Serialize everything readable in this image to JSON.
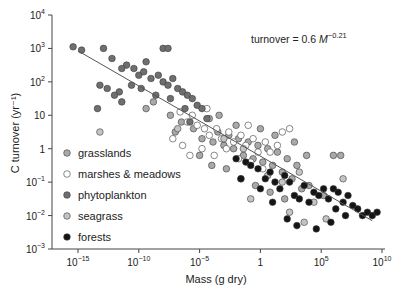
{
  "chart_data": {
    "type": "scatter",
    "title": "",
    "xlabel": "Mass (g dry)",
    "ylabel": "C turnover (yr⁻¹)",
    "xscale": "log",
    "yscale": "log",
    "xlim_exp": [
      -17,
      10
    ],
    "ylim_exp": [
      -3,
      4
    ],
    "x_ticks": [
      {
        "exp": -15,
        "base": "10",
        "sup": "−15"
      },
      {
        "exp": -10,
        "base": "10",
        "sup": "−10"
      },
      {
        "exp": -5,
        "base": "10",
        "sup": "−5"
      },
      {
        "exp": 0,
        "base": "1",
        "sup": ""
      },
      {
        "exp": 5,
        "base": "10",
        "sup": "5"
      },
      {
        "exp": 10,
        "base": "10",
        "sup": "10"
      }
    ],
    "y_ticks": [
      {
        "exp": 4,
        "base": "10",
        "sup": "4"
      },
      {
        "exp": 3,
        "base": "10",
        "sup": "3"
      },
      {
        "exp": 2,
        "base": "10",
        "sup": "2"
      },
      {
        "exp": 1,
        "base": "10",
        "sup": ""
      },
      {
        "exp": 0,
        "base": "1",
        "sup": ""
      },
      {
        "exp": -1,
        "base": "10",
        "sup": "−1"
      },
      {
        "exp": -2,
        "base": "10",
        "sup": "−2"
      },
      {
        "exp": -3,
        "base": "10",
        "sup": "−3"
      }
    ],
    "annotation": {
      "prefix": "turnover = 0.6 ",
      "var": "M",
      "sup": "−0.21"
    },
    "fit_line": {
      "equation": "turnover = 0.6 M^-0.21",
      "x_exp_range": [
        -15,
        9.2
      ]
    },
    "grid": false,
    "legend_position": "lower-left inside",
    "series": [
      {
        "name": "grasslands",
        "color": "#a9a9a9",
        "points_log": [
          [
            -5.5,
            0.6
          ],
          [
            -4.8,
            0.3
          ],
          [
            -4.2,
            0.9
          ],
          [
            -3.9,
            0.2
          ],
          [
            -3.5,
            0.5
          ],
          [
            -3.0,
            0.1
          ],
          [
            -2.6,
            0.4
          ],
          [
            -2.2,
            0.0
          ],
          [
            -1.8,
            0.3
          ],
          [
            -1.4,
            -0.2
          ],
          [
            -1.0,
            0.2
          ],
          [
            -0.6,
            -0.3
          ],
          [
            -0.2,
            0.1
          ],
          [
            0.2,
            -0.4
          ],
          [
            0.6,
            0.0
          ],
          [
            1.0,
            -0.5
          ],
          [
            1.4,
            -0.1
          ],
          [
            1.8,
            -0.7
          ],
          [
            2.2,
            -0.3
          ],
          [
            2.6,
            -0.9
          ],
          [
            3.0,
            -0.5
          ],
          [
            3.4,
            -1.2
          ],
          [
            -2.8,
            -0.6
          ],
          [
            -1.6,
            -0.9
          ],
          [
            -0.4,
            -1.1
          ],
          [
            0.8,
            -1.3
          ],
          [
            2.0,
            -1.5
          ],
          [
            4.0,
            -1.1
          ],
          [
            5.2,
            -1.4
          ],
          [
            6.0,
            -0.2
          ],
          [
            6.6,
            -0.2
          ],
          [
            -3.4,
            1.0
          ],
          [
            -2.0,
            0.7
          ],
          [
            -6.5,
            0.8
          ],
          [
            -7.4,
            1.0
          ],
          [
            -7.0,
            0.5
          ],
          [
            -9.4,
            1.2
          ],
          [
            -8.8,
            1.4
          ],
          [
            -5.0,
            -0.2
          ],
          [
            -4.0,
            -0.5
          ],
          [
            0.0,
            0.6
          ],
          [
            1.2,
            0.4
          ],
          [
            2.8,
            0.2
          ],
          [
            3.8,
            -0.2
          ]
        ]
      },
      {
        "name": "marshes & meadows",
        "color": "#ffffff",
        "points_log": [
          [
            -6.6,
            1.1
          ],
          [
            -6.0,
            0.8
          ],
          [
            -5.6,
            1.0
          ],
          [
            -5.2,
            0.7
          ],
          [
            -4.6,
            0.6
          ],
          [
            -4.2,
            0.4
          ],
          [
            -3.6,
            0.6
          ],
          [
            -3.2,
            0.3
          ],
          [
            -2.6,
            0.5
          ],
          [
            -2.2,
            0.2
          ],
          [
            -1.6,
            0.4
          ],
          [
            -1.2,
            0.1
          ],
          [
            -0.6,
            0.3
          ],
          [
            -0.2,
            -0.1
          ],
          [
            0.4,
            0.2
          ],
          [
            0.8,
            -0.1
          ],
          [
            1.4,
            0.1
          ],
          [
            -7.2,
            0.3
          ],
          [
            -6.4,
            0.1
          ],
          [
            -5.8,
            -0.2
          ],
          [
            -4.8,
            0.0
          ],
          [
            -3.8,
            -0.2
          ],
          [
            -2.8,
            0.0
          ],
          [
            -1.8,
            -0.3
          ],
          [
            -0.8,
            -0.4
          ],
          [
            0.2,
            -0.6
          ],
          [
            2.4,
            0.6
          ],
          [
            1.8,
            0.5
          ],
          [
            -1.0,
            0.7
          ],
          [
            -4.4,
            1.2
          ]
        ]
      },
      {
        "name": "phytoplankton",
        "color": "#6f6f6f",
        "points_log": [
          [
            -15.4,
            3.05
          ],
          [
            -14.7,
            2.95
          ],
          [
            -12.9,
            3.0
          ],
          [
            -12.2,
            2.7
          ],
          [
            -11.0,
            2.5
          ],
          [
            -10.4,
            2.4
          ],
          [
            -10.0,
            2.2
          ],
          [
            -9.6,
            2.3
          ],
          [
            -9.0,
            2.1
          ],
          [
            -8.4,
            2.2
          ],
          [
            -8.0,
            2.0
          ],
          [
            -7.6,
            1.9
          ],
          [
            -7.2,
            2.1
          ],
          [
            -6.8,
            1.8
          ],
          [
            -6.4,
            1.7
          ],
          [
            -6.0,
            1.6
          ],
          [
            -5.6,
            1.5
          ],
          [
            -5.2,
            1.3
          ],
          [
            -4.8,
            1.2
          ],
          [
            -10.6,
            1.9
          ],
          [
            -9.8,
            1.8
          ],
          [
            -11.6,
            1.7
          ],
          [
            -12.6,
            1.8
          ],
          [
            -13.2,
            1.9
          ],
          [
            -11.4,
            2.4
          ],
          [
            -12.0,
            1.6
          ],
          [
            -11.4,
            1.4
          ],
          [
            -13.4,
            1.2
          ],
          [
            -8.6,
            1.6
          ],
          [
            -7.4,
            1.5
          ],
          [
            -6.2,
            1.2
          ],
          [
            -5.8,
            0.8
          ],
          [
            -4.4,
            0.9
          ],
          [
            -9.4,
            2.6
          ],
          [
            -8.0,
            3.0
          ],
          [
            -7.6,
            3.0
          ]
        ]
      },
      {
        "name": "seagrass",
        "color": "#c4c4c4",
        "points_log": [
          [
            -13.2,
            0.5
          ],
          [
            -6.8,
            0.6
          ],
          [
            -3.0,
            0.3
          ],
          [
            -1.4,
            0.0
          ],
          [
            0.6,
            -0.8
          ],
          [
            1.8,
            -1.0
          ],
          [
            3.2,
            -0.7
          ],
          [
            4.4,
            -1.6
          ],
          [
            5.4,
            -2.1
          ],
          [
            3.6,
            -2.2
          ],
          [
            2.4,
            -1.9
          ],
          [
            6.8,
            -0.9
          ],
          [
            -0.8,
            -1.5
          ]
        ]
      },
      {
        "name": "forests",
        "color": "#151515",
        "points_log": [
          [
            -2.0,
            -0.3
          ],
          [
            -1.2,
            -0.4
          ],
          [
            -0.8,
            -0.5
          ],
          [
            -0.2,
            -0.6
          ],
          [
            0.4,
            -0.9
          ],
          [
            0.8,
            -0.7
          ],
          [
            1.2,
            -1.0
          ],
          [
            1.6,
            -1.2
          ],
          [
            2.0,
            -0.8
          ],
          [
            2.4,
            -1.0
          ],
          [
            2.8,
            -1.4
          ],
          [
            3.2,
            -1.5
          ],
          [
            3.6,
            -1.1
          ],
          [
            4.0,
            -1.6
          ],
          [
            4.4,
            -1.3
          ],
          [
            4.8,
            -1.4
          ],
          [
            5.2,
            -1.2
          ],
          [
            5.6,
            -1.5
          ],
          [
            6.0,
            -1.2
          ],
          [
            6.4,
            -1.3
          ],
          [
            6.8,
            -1.6
          ],
          [
            7.2,
            -1.4
          ],
          [
            7.6,
            -1.7
          ],
          [
            8.0,
            -1.8
          ],
          [
            8.4,
            -2.0
          ],
          [
            8.8,
            -1.9
          ],
          [
            9.2,
            -2.0
          ],
          [
            9.6,
            -1.9
          ],
          [
            1.0,
            -1.6
          ],
          [
            2.2,
            -2.1
          ],
          [
            3.0,
            -2.3
          ],
          [
            4.6,
            -2.4
          ],
          [
            5.8,
            -2.2
          ],
          [
            -1.6,
            -0.9
          ],
          [
            0.0,
            -1.2
          ],
          [
            6.2,
            -1.8
          ],
          [
            7.0,
            -2.0
          ]
        ]
      }
    ]
  }
}
